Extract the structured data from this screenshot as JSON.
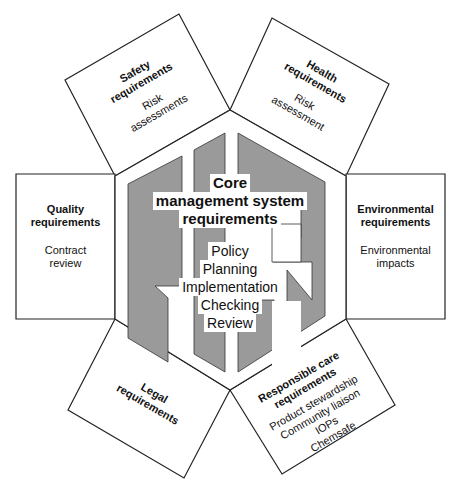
{
  "diagram": {
    "core": {
      "title_lines": [
        "Core",
        "management system",
        "requirements"
      ],
      "items": [
        "Policy",
        "Planning",
        "Implementation",
        "Checking",
        "Review"
      ]
    },
    "boxes": {
      "safety": {
        "title": [
          "Safety",
          "requirements"
        ],
        "items": [
          "Risk",
          "assessments"
        ]
      },
      "health": {
        "title": [
          "Health",
          "requirements"
        ],
        "items": [
          "Risk",
          "assessment"
        ]
      },
      "quality": {
        "title": [
          "Quality",
          "requirements"
        ],
        "items": [
          "Contract",
          "review"
        ]
      },
      "environmental": {
        "title": [
          "Environmental",
          "requirements"
        ],
        "items": [
          "Environmental",
          "impacts"
        ]
      },
      "legal": {
        "title": [
          "Legal",
          "requirements"
        ],
        "items": []
      },
      "responsible_care": {
        "title": [
          "Responsible care",
          "requirements"
        ],
        "items": [
          "Product stewardship",
          "Community liaison",
          "IOPs",
          "Chemsafe"
        ]
      }
    },
    "colors": {
      "fill_gray": "#9a9a9a",
      "stroke": "#222222",
      "background": "#ffffff"
    }
  }
}
